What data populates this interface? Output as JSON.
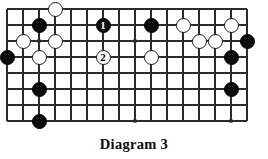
{
  "figure": {
    "kind": "go-board-diagram",
    "caption": "Diagram 3",
    "background_color": "#ffffff",
    "line_color": "#2b2b2b",
    "black_stone_color": "#0c0c0c",
    "white_stone_color": "#ffffff",
    "white_stone_border_color": "#1a1a1a"
  },
  "board": {
    "columns": 16,
    "rows": 8,
    "cell_size": 16,
    "origin_x": 7,
    "origin_y": 9,
    "stone_diameter": 15,
    "edges": {
      "left": true,
      "bottom": true,
      "top": false,
      "right": false
    },
    "star_points": [
      {
        "col": 2,
        "row": 2
      },
      {
        "col": 8,
        "row": 2
      },
      {
        "col": 2,
        "row": 7
      },
      {
        "col": 8,
        "row": 7
      },
      {
        "col": 14,
        "row": 7
      }
    ],
    "stones": [
      {
        "col": 3,
        "row": 0,
        "color": "white",
        "label": ""
      },
      {
        "col": 2,
        "row": 1,
        "color": "black",
        "label": ""
      },
      {
        "col": 1,
        "row": 2,
        "color": "white",
        "label": ""
      },
      {
        "col": 3,
        "row": 2,
        "color": "white",
        "label": ""
      },
      {
        "col": 0,
        "row": 3,
        "color": "black",
        "label": ""
      },
      {
        "col": 2,
        "row": 3,
        "color": "white",
        "label": ""
      },
      {
        "col": 6,
        "row": 1,
        "color": "black",
        "label": "1"
      },
      {
        "col": 6,
        "row": 3,
        "color": "white",
        "label": "2"
      },
      {
        "col": 9,
        "row": 1,
        "color": "black",
        "label": ""
      },
      {
        "col": 9,
        "row": 3,
        "color": "white",
        "label": ""
      },
      {
        "col": 11,
        "row": 1,
        "color": "white",
        "label": ""
      },
      {
        "col": 12,
        "row": 2,
        "color": "white",
        "label": ""
      },
      {
        "col": 14,
        "row": 1,
        "color": "white",
        "label": ""
      },
      {
        "col": 13,
        "row": 2,
        "color": "white",
        "label": ""
      },
      {
        "col": 15,
        "row": 2,
        "color": "black",
        "label": ""
      },
      {
        "col": 14,
        "row": 3,
        "color": "black",
        "label": ""
      },
      {
        "col": 2,
        "row": 5,
        "color": "black",
        "label": ""
      },
      {
        "col": 14,
        "row": 5,
        "color": "black",
        "label": ""
      },
      {
        "col": 2,
        "row": 7,
        "color": "black",
        "label": ""
      }
    ]
  },
  "move_sequence": [
    {
      "number": "1",
      "color": "black"
    },
    {
      "number": "2",
      "color": "white"
    }
  ]
}
